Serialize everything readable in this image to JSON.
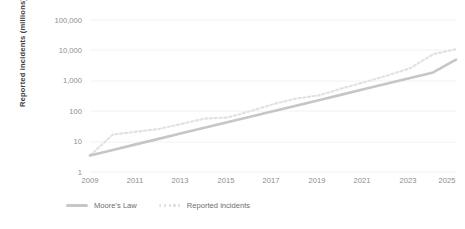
{
  "chart_data": {
    "type": "line",
    "title": "",
    "subtitle": "",
    "xlabel": "",
    "ylabel": "Reported incidents (millions)",
    "yscale": "log",
    "ylim": [
      1,
      100000
    ],
    "xlim": [
      2009,
      2025
    ],
    "grid": true,
    "legend_position": "bottom-left",
    "y_tick_labels": [
      "100,000",
      "10,000",
      "1,000",
      "100",
      "10",
      "1"
    ],
    "y_tick_values": [
      100000,
      10000,
      1000,
      100,
      10,
      1
    ],
    "x_tick_labels": [
      "2009",
      "2011",
      "2013",
      "2015",
      "2017",
      "2019",
      "2021",
      "2023",
      "2025"
    ],
    "x_tick_values": [
      2009,
      2011,
      2013,
      2015,
      2017,
      2019,
      2021,
      2023,
      2025
    ],
    "x": [
      2009,
      2010,
      2011,
      2012,
      2013,
      2014,
      2015,
      2016,
      2017,
      2018,
      2019,
      2020,
      2021,
      2022,
      2023,
      2024,
      2025
    ],
    "series": [
      {
        "name": "Moore's Law",
        "style": "solid",
        "color": "#c6c6c6",
        "values": [
          3.5,
          5.3,
          8.1,
          12.3,
          18.7,
          28.4,
          43.2,
          65.7,
          100,
          152,
          231,
          351,
          534,
          812,
          1235,
          1878,
          5000
        ]
      },
      {
        "name": "Reported incidents",
        "style": "dotted",
        "color": "#e2e2e2",
        "values": [
          3.5,
          17,
          21,
          26,
          38,
          57,
          62,
          100,
          170,
          260,
          330,
          560,
          900,
          1500,
          2600,
          7500,
          11000
        ]
      }
    ]
  },
  "legend": {
    "items": [
      {
        "label": "Moore's Law",
        "color": "#c6c6c6",
        "style": "solid"
      },
      {
        "label": "Reported incidents",
        "color": "#e2e2e2",
        "style": "dotted"
      }
    ]
  },
  "colors": {
    "background": "#ffffff",
    "gridline": "#f0f0f0",
    "tick_text": "#8d8d8d",
    "axis_title": "#3f3f3f",
    "moores_law": "#c6c6c6",
    "reported_incidents": "#e2e2e2"
  }
}
